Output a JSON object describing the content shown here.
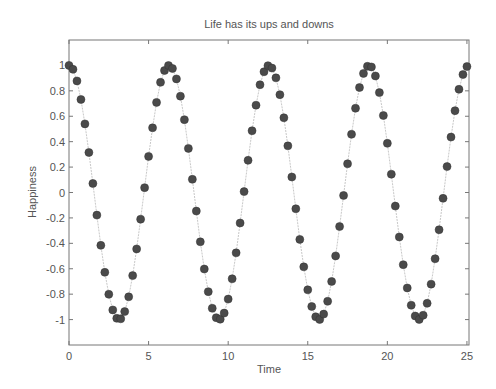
{
  "chart_data": {
    "type": "line",
    "title": "Life has its ups and downs",
    "xlabel": "Time",
    "ylabel": "Happiness",
    "xlim": [
      0,
      25.13
    ],
    "ylim": [
      -1.2,
      1.2
    ],
    "xticks": [
      0,
      5,
      10,
      15,
      20,
      25
    ],
    "yticks": [
      1,
      0.8,
      0.6,
      0.4,
      0.2,
      0,
      -0.2,
      -0.4,
      -0.6,
      -0.8,
      -1
    ],
    "ytick_labels": [
      "1",
      "0.8",
      "0.6",
      "0.4",
      "0.2",
      "0",
      "-0.2",
      "-0.4",
      "-0.6",
      "-0.8",
      "-1"
    ],
    "grid": false,
    "legend": null,
    "series": [
      {
        "name": "cos(t)",
        "marker": "circle",
        "marker_color": "#4a4a4a",
        "line_color": "#c8c8c8",
        "x_start": 0,
        "x_step": 0.25,
        "values": [
          1.0,
          0.969,
          0.878,
          0.732,
          0.54,
          0.315,
          0.071,
          -0.178,
          -0.416,
          -0.628,
          -0.801,
          -0.924,
          -0.99,
          -0.994,
          -0.937,
          -0.821,
          -0.654,
          -0.444,
          -0.21,
          0.038,
          0.284,
          0.509,
          0.709,
          0.867,
          0.96,
          0.999,
          0.976,
          0.894,
          0.758,
          0.573,
          0.347,
          0.104,
          -0.146,
          -0.388,
          -0.602,
          -0.78,
          -0.911,
          -0.985,
          -0.997,
          -0.949,
          -0.839,
          -0.679,
          -0.475,
          -0.24,
          0.007,
          0.253,
          0.486,
          0.687,
          0.848,
          0.95,
          0.998,
          0.979,
          0.902,
          0.77,
          0.588,
          0.367,
          0.122,
          -0.128,
          -0.369,
          -0.585,
          -0.766,
          -0.897,
          -0.978,
          -0.999,
          -0.957,
          -0.856,
          -0.7,
          -0.499,
          -0.268,
          -0.023,
          0.226,
          0.458,
          0.663,
          0.826,
          0.937,
          0.993,
          0.988,
          0.917,
          0.786,
          0.606,
          0.387,
          0.144,
          -0.107,
          -0.35,
          -0.568,
          -0.751,
          -0.887,
          -0.972,
          -0.999,
          -0.966,
          -0.872,
          -0.721,
          -0.521,
          -0.293,
          -0.046,
          0.204,
          0.436,
          0.644,
          0.812,
          0.928,
          0.991
        ]
      }
    ]
  }
}
